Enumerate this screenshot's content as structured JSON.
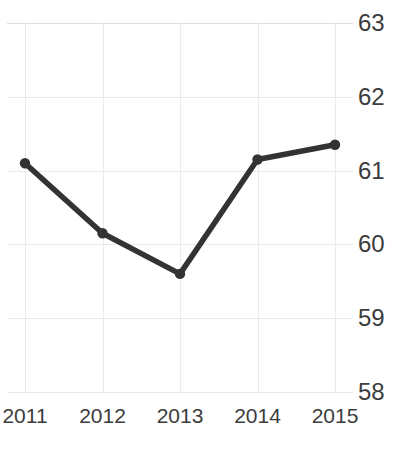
{
  "chart_data": {
    "type": "line",
    "title": "",
    "xlabel": "",
    "ylabel": "",
    "categories": [
      "2011",
      "2012",
      "2013",
      "2014",
      "2015"
    ],
    "values": [
      61.1,
      60.15,
      59.6,
      61.15,
      61.35
    ],
    "series": [
      {
        "name": "series-1",
        "values": [
          61.1,
          60.15,
          59.6,
          61.15,
          61.35
        ]
      }
    ],
    "ylim": [
      58,
      63
    ],
    "yticks": [
      "58",
      "59",
      "60",
      "61",
      "62",
      "63"
    ],
    "ytick_values": [
      58,
      59,
      60,
      61,
      62,
      63
    ],
    "y_axis_position": "right",
    "grid": true,
    "legend": "none",
    "markers": true,
    "line_color": "#333333",
    "grid_color": "#e9e9e9",
    "text_color": "#3c3c3c",
    "background": "#ffffff"
  },
  "title": {
    "text": ""
  }
}
